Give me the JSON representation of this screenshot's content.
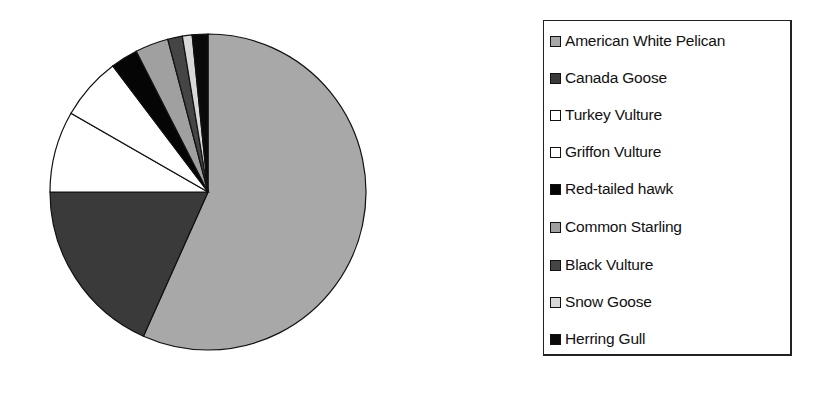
{
  "chart_data": {
    "type": "pie",
    "title": "",
    "legend_position": "right",
    "start_angle_deg": 0,
    "direction": "clockwise",
    "categories": [
      "American White Pelican",
      "Canada Goose",
      "Turkey Vulture",
      "Griffon Vulture",
      "Red-tailed hawk",
      "Common Starling",
      "Black Vulture",
      "Snow Goose",
      "Herring Gull"
    ],
    "values": [
      56.7,
      18.3,
      8.3,
      6.4,
      2.8,
      3.4,
      1.5,
      1.0,
      1.6
    ],
    "colors": [
      "#a8a8a8",
      "#3a3a3a",
      "#ffffff",
      "#ffffff",
      "#050505",
      "#a0a0a0",
      "#454545",
      "#d8d8d8",
      "#0a0a0a"
    ]
  },
  "legend": {
    "items": [
      {
        "label": "American White Pelican",
        "color": "#a8a8a8"
      },
      {
        "label": "Canada Goose",
        "color": "#3a3a3a"
      },
      {
        "label": "Turkey Vulture",
        "color": "#ffffff"
      },
      {
        "label": "Griffon Vulture",
        "color": "#ffffff"
      },
      {
        "label": "Red-tailed hawk",
        "color": "#050505"
      },
      {
        "label": "Common Starling",
        "color": "#a0a0a0"
      },
      {
        "label": "Black Vulture",
        "color": "#454545"
      },
      {
        "label": "Snow Goose",
        "color": "#d8d8d8"
      },
      {
        "label": "Herring Gull",
        "color": "#0a0a0a"
      }
    ]
  }
}
